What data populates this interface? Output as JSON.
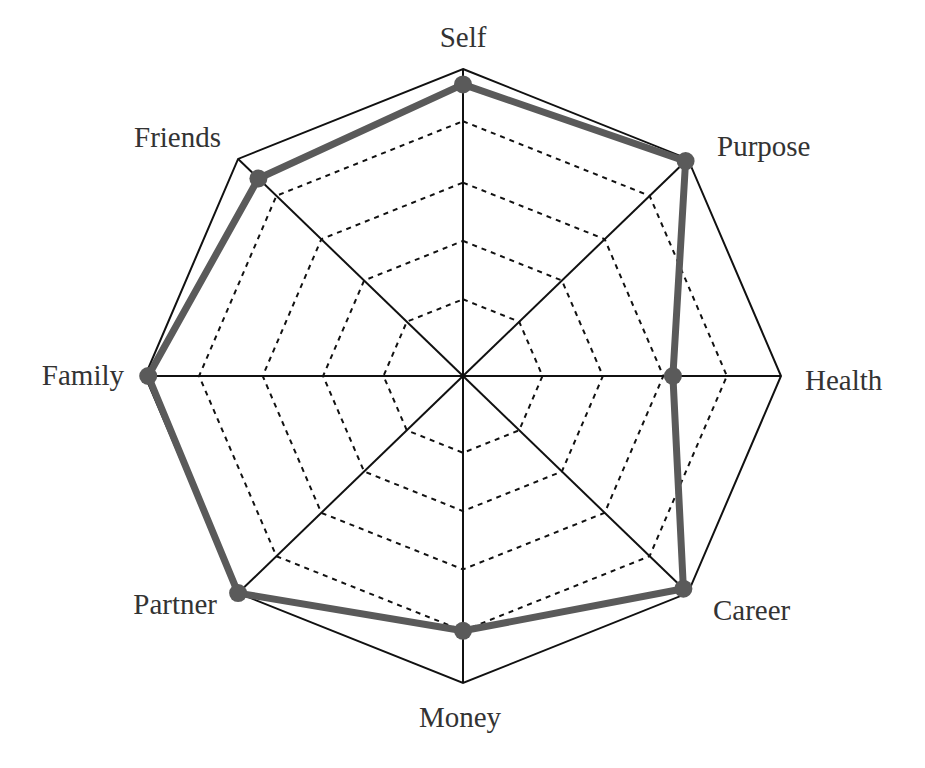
{
  "chart_data": {
    "type": "radar",
    "title": "",
    "categories": [
      "Self",
      "Purpose",
      "Health",
      "Career",
      "Money",
      "Partner",
      "Family",
      "Friends"
    ],
    "series": [
      {
        "name": "Score",
        "values": [
          0.95,
          0.99,
          0.66,
          0.98,
          0.83,
          1.0,
          0.99,
          0.91
        ],
        "color": "#5a5a5a"
      }
    ],
    "rlim": [
      0,
      1
    ],
    "grid_rings": [
      0.25,
      0.44,
      0.63,
      0.83
    ],
    "grid": true,
    "legend": "none"
  },
  "labels": {
    "self": "Self",
    "purpose": "Purpose",
    "health": "Health",
    "career": "Career",
    "money": "Money",
    "partner": "Partner",
    "family": "Family",
    "friends": "Friends"
  },
  "colors": {
    "series": "#5a5a5a",
    "grid": "#111111",
    "text": "#333333"
  }
}
